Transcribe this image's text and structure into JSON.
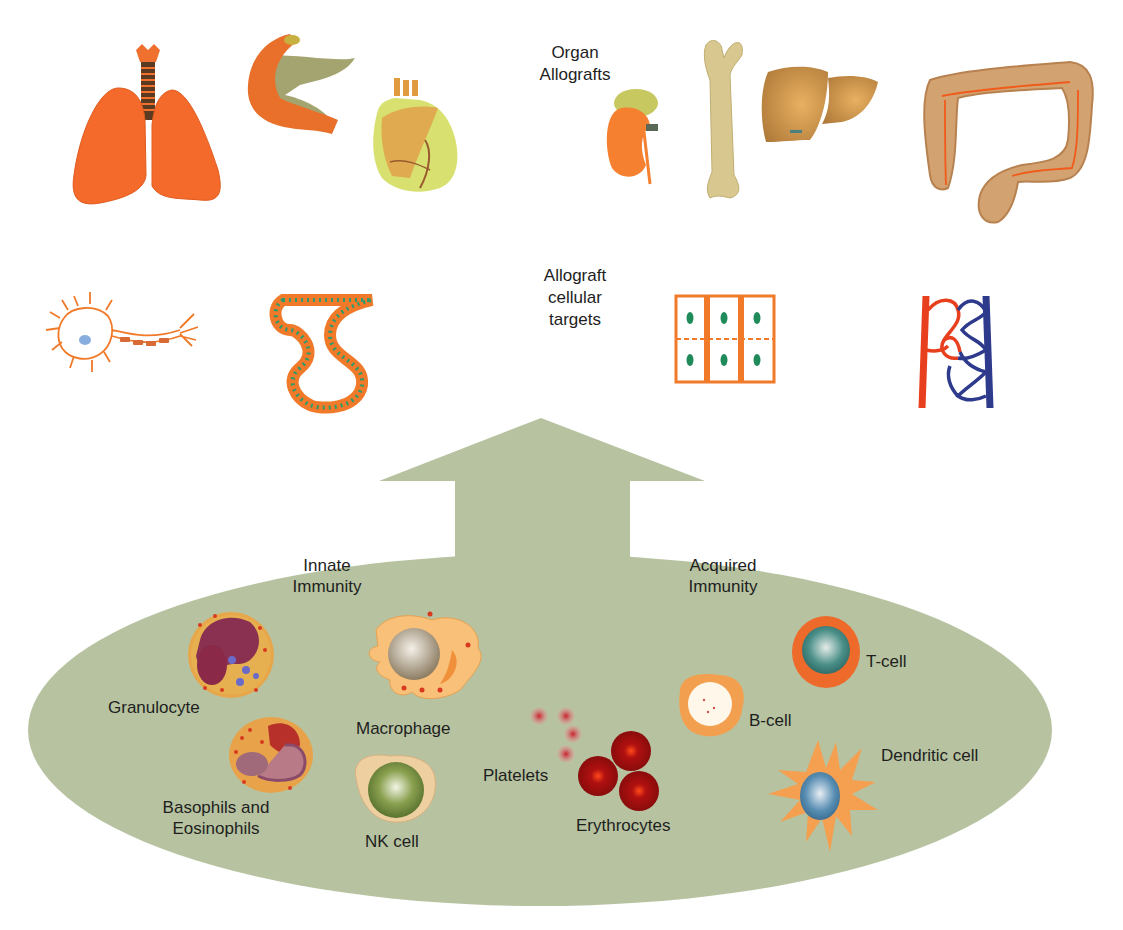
{
  "headings": {
    "organ_allografts": [
      "Organ",
      "Allografts"
    ],
    "cellular_targets": [
      "Allograft",
      "cellular",
      "targets"
    ],
    "innate": [
      "Innate",
      "Immunity"
    ],
    "acquired": [
      "Acquired",
      "Immunity"
    ]
  },
  "organs": [
    {
      "name": "lungs",
      "icon": "lungs-icon"
    },
    {
      "name": "pancreas",
      "icon": "pancreas-icon"
    },
    {
      "name": "heart",
      "icon": "heart-icon"
    },
    {
      "name": "kidney",
      "icon": "kidney-icon"
    },
    {
      "name": "bone",
      "icon": "femur-bone-icon"
    },
    {
      "name": "liver",
      "icon": "liver-icon"
    },
    {
      "name": "intestine",
      "icon": "colon-icon"
    }
  ],
  "cellular_targets": [
    {
      "name": "neuron",
      "icon": "neuron-icon"
    },
    {
      "name": "epithelium",
      "icon": "epithelial-tube-icon"
    },
    {
      "name": "parenchymal cells",
      "icon": "cell-grid-icon"
    },
    {
      "name": "vasculature",
      "icon": "capillary-network-icon"
    }
  ],
  "innate_cells": {
    "granulocyte": "Granulocyte",
    "macrophage": "Macrophage",
    "basophils_line1": "Basophils and",
    "basophils_line2": "Eosinophils",
    "nk": "NK cell"
  },
  "blood_cells": {
    "platelets": "Platelets",
    "erythrocytes": "Erythrocytes"
  },
  "acquired_cells": {
    "tcell": "T-cell",
    "bcell": "B-cell",
    "dendritic": "Dendritic cell"
  },
  "colors": {
    "immune_field": "#b7c3a0",
    "organ_orange": "#f0702a",
    "artery_red": "#e8401e",
    "vein_blue": "#2e3a8c",
    "nucleus_green": "#1f8a5a"
  }
}
